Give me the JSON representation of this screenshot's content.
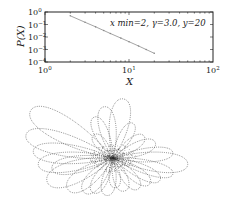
{
  "chart_data": [
    {
      "type": "line",
      "title": "",
      "xlabel": "X",
      "ylabel": "P(X)",
      "xscale": "log",
      "yscale": "log",
      "xlim": [
        1,
        100
      ],
      "ylim": [
        0.0001,
        1
      ],
      "x_ticks": [
        "10^0",
        "10^1",
        "10^2"
      ],
      "y_ticks": [
        "10^0",
        "10^-1",
        "10^-2",
        "10^-3",
        "10^-4"
      ],
      "annotation": "x min=2, γ=3.0, y=20",
      "grid": false,
      "series": [
        {
          "name": "P(X)",
          "x": [
            2,
            3,
            4,
            5,
            6,
            8,
            10,
            13,
            16,
            20
          ],
          "y": [
            0.5,
            0.15,
            0.065,
            0.033,
            0.019,
            0.0082,
            0.0042,
            0.0019,
            0.001,
            0.0005
          ]
        }
      ]
    },
    {
      "type": "scatter",
      "title": "",
      "description": "Lévy-flight-like random walk trajectory: dotted loops radiating from a dense central cluster",
      "xlabel": "",
      "ylabel": "",
      "axes_visible": false
    }
  ],
  "labels": {
    "xlabel": "X",
    "ylabel_P": "P(",
    "ylabel_X": "X",
    "ylabel_close": ")",
    "annotation": "x min=2, γ=3.0, y=20",
    "xt0": "10",
    "xt0e": "0",
    "xt1": "10",
    "xt1e": "1",
    "xt2": "10",
    "xt2e": "2",
    "yt0": "10",
    "yt0e": "0",
    "yt1": "10",
    "yt1e": "−1",
    "yt2": "10",
    "yt2e": "−2",
    "yt3": "10",
    "yt3e": "−3",
    "yt4": "10",
    "yt4e": "−4"
  },
  "colors": {
    "line": "#9a9a9a",
    "axes": "#222222",
    "trajectory": "#555555"
  }
}
